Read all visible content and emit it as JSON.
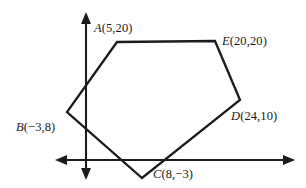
{
  "figure": {
    "background_color": "#ffffff",
    "ink_color": "#1b1b1b",
    "width_px": 306,
    "height_px": 188
  },
  "axes": {
    "x_axis_name": "horizontal-axis",
    "y_axis_name": "vertical-axis",
    "origin_px": {
      "x": 86,
      "y": 160
    },
    "x_axis_px": {
      "x1": 55,
      "x2": 295,
      "y": 160
    },
    "y_axis_px": {
      "y1": 12,
      "y2": 180,
      "x": 86
    },
    "arrows": [
      "left",
      "right",
      "up",
      "down"
    ],
    "tick_labels": [],
    "axis_titles": {
      "x": "",
      "y": ""
    },
    "grid": false
  },
  "labels": {
    "a": {
      "vertex": "A",
      "coords": "(5,20)"
    },
    "b": {
      "vertex": "B",
      "coords": "(−3,8)"
    },
    "c": {
      "vertex": "C",
      "coords": "(8,−3)"
    },
    "d": {
      "vertex": "D",
      "coords": "(24,10)"
    },
    "e": {
      "vertex": "E",
      "coords": "(20,20)"
    }
  },
  "chart_data": {
    "type": "scatter",
    "title": "",
    "xlabel": "",
    "ylabel": "",
    "grid": false,
    "legend": "none",
    "xlim": [
      -5,
      33
    ],
    "ylim": [
      -5,
      25
    ],
    "series": [
      {
        "name": "Polygon ABCDE",
        "closed": true,
        "points": [
          {
            "label": "A",
            "x": 5,
            "y": 20,
            "px": {
              "x": 117,
              "y": 42
            }
          },
          {
            "label": "E",
            "x": 20,
            "y": 20,
            "px": {
              "x": 215,
              "y": 41
            }
          },
          {
            "label": "D",
            "x": 24,
            "y": 10,
            "px": {
              "x": 240,
              "y": 100
            }
          },
          {
            "label": "C",
            "x": 8,
            "y": -3,
            "px": {
              "x": 142,
              "y": 178
            }
          },
          {
            "label": "B",
            "x": -3,
            "y": 8,
            "px": {
              "x": 67,
              "y": 112
            }
          }
        ]
      }
    ],
    "polygon_path_px": "117,42 215,41 240,100 142,178 67,112"
  }
}
